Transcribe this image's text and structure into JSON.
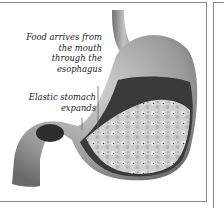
{
  "figure": {
    "labels": [
      {
        "id": "food-arrives",
        "lines": [
          "Food arrives from",
          "the mouth",
          "through the",
          "esophagus"
        ]
      },
      {
        "id": "elastic-stomach",
        "lines": [
          "Elastic stomach",
          "expands"
        ]
      }
    ],
    "colors": {
      "border": "#8a8a8a",
      "stomach": "#9a9a9a",
      "interior": "#3a3a3a",
      "food": "#d8d8d8"
    }
  }
}
